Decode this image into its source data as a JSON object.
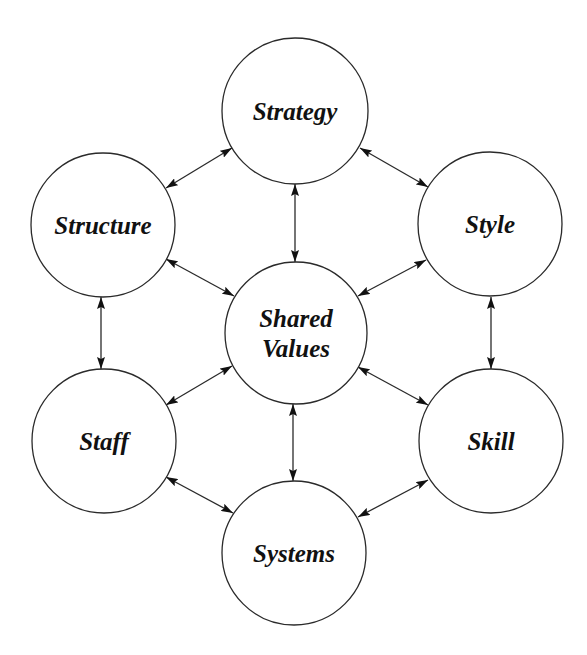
{
  "diagram": {
    "colors": {
      "stroke": "#2a2a2a",
      "fill": "#ffffff",
      "text": "#111111"
    },
    "nodes": [
      {
        "id": "strategy",
        "label": "Strategy",
        "cx": 295,
        "cy": 111,
        "r": 73
      },
      {
        "id": "structure",
        "label": "Structure",
        "cx": 103,
        "cy": 225,
        "r": 72
      },
      {
        "id": "style",
        "label": "Style",
        "cx": 490,
        "cy": 224,
        "r": 72
      },
      {
        "id": "shared-values",
        "label": "Shared Values",
        "lines": [
          "Shared",
          "Values"
        ],
        "cx": 296,
        "cy": 333,
        "r": 71
      },
      {
        "id": "staff",
        "label": "Staff",
        "cx": 104,
        "cy": 441,
        "r": 72
      },
      {
        "id": "skill",
        "label": "Skill",
        "cx": 491,
        "cy": 441,
        "r": 72
      },
      {
        "id": "systems",
        "label": "Systems",
        "cx": 294,
        "cy": 553,
        "r": 72
      }
    ],
    "edges": [
      {
        "from": "structure",
        "to": "strategy",
        "x1": 166,
        "y1": 188,
        "x2": 232,
        "y2": 148,
        "bidirectional": true
      },
      {
        "from": "strategy",
        "to": "style",
        "x1": 360,
        "y1": 148,
        "x2": 428,
        "y2": 187,
        "bidirectional": true
      },
      {
        "from": "strategy",
        "to": "shared-values",
        "x1": 295,
        "y1": 184,
        "x2": 295,
        "y2": 262,
        "bidirectional": true
      },
      {
        "from": "structure",
        "to": "shared-values",
        "x1": 166,
        "y1": 259,
        "x2": 234,
        "y2": 296,
        "bidirectional": true
      },
      {
        "from": "style",
        "to": "shared-values",
        "x1": 426,
        "y1": 260,
        "x2": 358,
        "y2": 296,
        "bidirectional": true
      },
      {
        "from": "structure",
        "to": "staff",
        "x1": 101,
        "y1": 297,
        "x2": 101,
        "y2": 369,
        "bidirectional": true
      },
      {
        "from": "style",
        "to": "skill",
        "x1": 491,
        "y1": 297,
        "x2": 491,
        "y2": 369,
        "bidirectional": true
      },
      {
        "from": "staff",
        "to": "shared-values",
        "x1": 166,
        "y1": 405,
        "x2": 232,
        "y2": 366,
        "bidirectional": true
      },
      {
        "from": "shared-values",
        "to": "skill",
        "x1": 358,
        "y1": 367,
        "x2": 428,
        "y2": 405,
        "bidirectional": true
      },
      {
        "from": "shared-values",
        "to": "systems",
        "x1": 293,
        "y1": 404,
        "x2": 293,
        "y2": 481,
        "bidirectional": true
      },
      {
        "from": "staff",
        "to": "systems",
        "x1": 166,
        "y1": 477,
        "x2": 233,
        "y2": 513,
        "bidirectional": true
      },
      {
        "from": "skill",
        "to": "systems",
        "x1": 428,
        "y1": 480,
        "x2": 358,
        "y2": 517,
        "bidirectional": true
      }
    ]
  }
}
